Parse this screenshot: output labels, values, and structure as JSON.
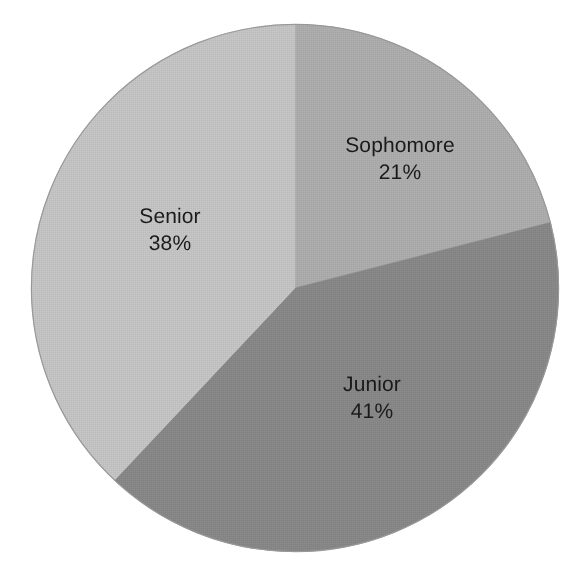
{
  "chart_data": {
    "type": "pie",
    "title": "",
    "subtitle": "",
    "xlabel": "",
    "ylabel": "",
    "legend": "none",
    "grid": false,
    "categories": [
      "Sophomore",
      "Junior",
      "Senior"
    ],
    "values": [
      21,
      41,
      38
    ],
    "unit": "%",
    "start_angle_deg": 0,
    "direction": "clockwise",
    "slices": [
      {
        "label": "Sophomore",
        "value": 21,
        "value_text": "21%",
        "color": "#b0b0b0",
        "start_deg": 0,
        "end_deg": 75.6
      },
      {
        "label": "Junior",
        "value": 41,
        "value_text": "41%",
        "color": "#8a8a8a",
        "start_deg": 75.6,
        "end_deg": 223.2
      },
      {
        "label": "Senior",
        "value": 38,
        "value_text": "38%",
        "color": "#c8c8c8",
        "start_deg": 223.2,
        "end_deg": 360
      }
    ]
  },
  "figure": {
    "background_color": "#ffffff",
    "outline_color": "#8f8f8f",
    "label_text_color": "#1a1a1a"
  }
}
